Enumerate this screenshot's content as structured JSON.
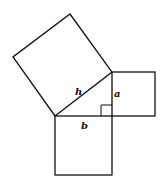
{
  "diagram": {
    "labels": {
      "hypotenuse": "h",
      "vertical_leg": "a",
      "horizontal_leg": "b"
    },
    "stroke_color": "#111111",
    "background": "#ffffff"
  }
}
